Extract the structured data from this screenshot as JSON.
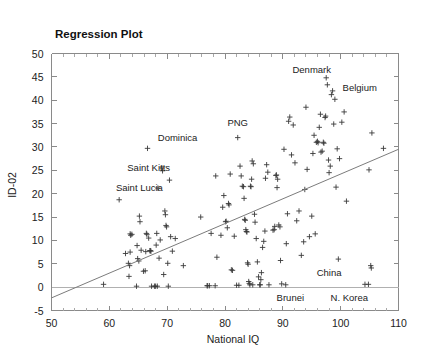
{
  "chart_data": {
    "type": "scatter",
    "title": "Regression Plot",
    "xlabel": "National IQ",
    "ylabel": "ID-02",
    "xlim": [
      50,
      110
    ],
    "ylim": [
      -5,
      50
    ],
    "xticks": [
      50,
      60,
      70,
      80,
      90,
      100,
      110
    ],
    "xtick_labels": [
      "50",
      "60",
      "70",
      "80",
      "90",
      "100",
      "110"
    ],
    "yticks": [
      -5,
      0,
      5,
      10,
      15,
      20,
      25,
      30,
      35,
      40,
      45,
      50
    ],
    "ytick_labels": [
      "-5",
      "0",
      "5",
      "10",
      "15",
      "20",
      "25",
      "30",
      "35",
      "40",
      "45",
      "50"
    ],
    "x_minor_step": 2,
    "grid": false,
    "legend": "none",
    "marker": "plus",
    "regression_line": {
      "x0": 50,
      "y0": -2.3,
      "x1": 110,
      "y1": 29.5,
      "slope": 0.53,
      "intercept": -28.8
    },
    "annotations": [
      {
        "text": "Denmark",
        "x": 95.0,
        "y": 46.5,
        "anchor": "middle"
      },
      {
        "text": "Belgium",
        "x": 103.3,
        "y": 42.6,
        "anchor": "middle"
      },
      {
        "text": "Dominica",
        "x": 71.8,
        "y": 32.0,
        "anchor": "middle"
      },
      {
        "text": "PNG",
        "x": 82.2,
        "y": 35.2,
        "anchor": "middle"
      },
      {
        "text": "Saint Kitts",
        "x": 66.8,
        "y": 25.6,
        "anchor": "middle"
      },
      {
        "text": "Saint Lucia",
        "x": 65.2,
        "y": 21.2,
        "anchor": "middle"
      },
      {
        "text": "China",
        "x": 98.0,
        "y": 3.1,
        "anchor": "middle"
      },
      {
        "text": "Brunei",
        "x": 91.3,
        "y": -2.4,
        "anchor": "middle"
      },
      {
        "text": "N. Korea",
        "x": 101.5,
        "y": -2.4,
        "anchor": "middle"
      }
    ],
    "points": [
      [
        59.0,
        0.6
      ],
      [
        61.7,
        18.7
      ],
      [
        63.6,
        11.4
      ],
      [
        63.7,
        11.1
      ],
      [
        63.6,
        7.5
      ],
      [
        63.3,
        5.1
      ],
      [
        63.5,
        4.6
      ],
      [
        63.4,
        2.3
      ],
      [
        62.8,
        7.2
      ],
      [
        64.7,
        0.2
      ],
      [
        64.8,
        8.9
      ],
      [
        64.9,
        6.1
      ],
      [
        65.1,
        5.6
      ],
      [
        65.2,
        15.2
      ],
      [
        65.3,
        14.0
      ],
      [
        65.5,
        7.9
      ],
      [
        65.9,
        3.4
      ],
      [
        66.2,
        3.5
      ],
      [
        66.3,
        7.6
      ],
      [
        66.4,
        11.5
      ],
      [
        66.5,
        11.3
      ],
      [
        66.6,
        29.7
      ],
      [
        66.8,
        10.5
      ],
      [
        67.0,
        7.8
      ],
      [
        67.1,
        7.8
      ],
      [
        67.2,
        7.7
      ],
      [
        67.3,
        0.2
      ],
      [
        67.8,
        0.2
      ],
      [
        68.0,
        0.2
      ],
      [
        68.3,
        0.2
      ],
      [
        68.1,
        9.0
      ],
      [
        68.2,
        11.5
      ],
      [
        68.4,
        21.2
      ],
      [
        68.6,
        6.2
      ],
      [
        68.8,
        10.1
      ],
      [
        69.1,
        25.5
      ],
      [
        69.2,
        24.9
      ],
      [
        69.4,
        2.7
      ],
      [
        69.6,
        16.3
      ],
      [
        69.7,
        15.5
      ],
      [
        69.8,
        13.2
      ],
      [
        69.9,
        12.9
      ],
      [
        70.1,
        5.1
      ],
      [
        70.2,
        0.2
      ],
      [
        70.4,
        22.9
      ],
      [
        70.6,
        10.8
      ],
      [
        70.9,
        7.7
      ],
      [
        71.4,
        10.4
      ],
      [
        72.8,
        4.6
      ],
      [
        75.8,
        15.0
      ],
      [
        76.9,
        0.3
      ],
      [
        77.3,
        0.3
      ],
      [
        77.6,
        11.5
      ],
      [
        78.3,
        0.3
      ],
      [
        78.4,
        23.8
      ],
      [
        78.6,
        6.4
      ],
      [
        79.3,
        11.1
      ],
      [
        79.6,
        17.1
      ],
      [
        79.8,
        19.6
      ],
      [
        80.1,
        14.0
      ],
      [
        80.2,
        14.1
      ],
      [
        80.4,
        12.7
      ],
      [
        80.6,
        17.9
      ],
      [
        80.7,
        17.6
      ],
      [
        80.9,
        24.2
      ],
      [
        81.1,
        3.7
      ],
      [
        81.3,
        3.6
      ],
      [
        81.6,
        10.9
      ],
      [
        82.0,
        0.4
      ],
      [
        82.2,
        32.0
      ],
      [
        82.6,
        25.9
      ],
      [
        82.8,
        23.8
      ],
      [
        83.0,
        21.6
      ],
      [
        83.2,
        21.5
      ],
      [
        83.3,
        19.0
      ],
      [
        83.4,
        14.5
      ],
      [
        83.5,
        14.3
      ],
      [
        83.6,
        12.3
      ],
      [
        83.7,
        11.9
      ],
      [
        83.8,
        11.8
      ],
      [
        83.9,
        5.2
      ],
      [
        84.0,
        4.9
      ],
      [
        84.1,
        1.2
      ],
      [
        84.2,
        0.8
      ],
      [
        84.3,
        0.5
      ],
      [
        84.4,
        21.6
      ],
      [
        84.5,
        21.5
      ],
      [
        84.6,
        23.1
      ],
      [
        84.7,
        27.0
      ],
      [
        84.9,
        26.4
      ],
      [
        85.1,
        15.6
      ],
      [
        85.2,
        13.9
      ],
      [
        85.4,
        10.4
      ],
      [
        85.6,
        5.4
      ],
      [
        85.8,
        2.2
      ],
      [
        86.0,
        0.5
      ],
      [
        86.2,
        1.6
      ],
      [
        86.3,
        3.1
      ],
      [
        86.5,
        8.5
      ],
      [
        86.7,
        9.8
      ],
      [
        86.9,
        12.0
      ],
      [
        87.0,
        23.3
      ],
      [
        87.2,
        26.2
      ],
      [
        87.4,
        24.6
      ],
      [
        87.6,
        0.5
      ],
      [
        88.3,
        12.2
      ],
      [
        88.5,
        12.3
      ],
      [
        88.6,
        13.0
      ],
      [
        88.8,
        23.9
      ],
      [
        88.9,
        24.0
      ],
      [
        89.0,
        21.3
      ],
      [
        89.1,
        23.1
      ],
      [
        89.3,
        13.3
      ],
      [
        89.5,
        12.9
      ],
      [
        89.6,
        5.7
      ],
      [
        89.8,
        0.7
      ],
      [
        90.2,
        29.5
      ],
      [
        90.5,
        0.5
      ],
      [
        90.6,
        9.3
      ],
      [
        90.8,
        15.7
      ],
      [
        91.0,
        35.5
      ],
      [
        91.2,
        36.4
      ],
      [
        91.5,
        28.3
      ],
      [
        91.8,
        34.7
      ],
      [
        92.1,
        26.6
      ],
      [
        92.4,
        14.2
      ],
      [
        92.8,
        16.3
      ],
      [
        93.2,
        6.8
      ],
      [
        93.6,
        9.7
      ],
      [
        93.8,
        20.9
      ],
      [
        94.0,
        38.5
      ],
      [
        94.2,
        25.2
      ],
      [
        94.6,
        10.8
      ],
      [
        95.0,
        15.2
      ],
      [
        95.2,
        28.6
      ],
      [
        95.4,
        32.5
      ],
      [
        95.6,
        11.4
      ],
      [
        95.8,
        31.0
      ],
      [
        96.0,
        31.2
      ],
      [
        96.1,
        30.9
      ],
      [
        96.3,
        34.2
      ],
      [
        96.5,
        37.0
      ],
      [
        96.6,
        28.9
      ],
      [
        96.8,
        29.1
      ],
      [
        97.0,
        31.0
      ],
      [
        97.1,
        30.8
      ],
      [
        97.3,
        36.3
      ],
      [
        97.4,
        36.6
      ],
      [
        97.5,
        44.8
      ],
      [
        97.7,
        43.3
      ],
      [
        97.9,
        27.2
      ],
      [
        98.0,
        24.5
      ],
      [
        98.2,
        25.9
      ],
      [
        98.4,
        41.2
      ],
      [
        98.6,
        42.0
      ],
      [
        98.8,
        34.9
      ],
      [
        99.0,
        40.2
      ],
      [
        99.2,
        21.4
      ],
      [
        99.4,
        29.6
      ],
      [
        99.6,
        6.0
      ],
      [
        99.8,
        27.5
      ],
      [
        100.2,
        35.3
      ],
      [
        100.6,
        37.5
      ],
      [
        101.0,
        18.4
      ],
      [
        104.2,
        0.6
      ],
      [
        104.8,
        0.6
      ],
      [
        104.9,
        25.1
      ],
      [
        105.2,
        4.6
      ],
      [
        105.3,
        4.1
      ],
      [
        105.4,
        33.0
      ],
      [
        107.4,
        29.7
      ],
      [
        63.9,
        11.3
      ],
      [
        84.8,
        0.5
      ],
      [
        86.1,
        0.5
      ],
      [
        82.4,
        0.4
      ],
      [
        77.0,
        0.3
      ]
    ]
  }
}
